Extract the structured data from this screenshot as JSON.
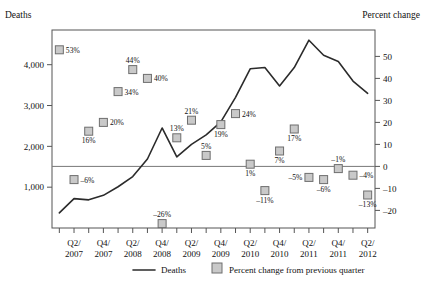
{
  "chart_data": {
    "type": "line",
    "title": "",
    "xlabel": "",
    "ylabel": "Deaths",
    "y2label": "Percent change",
    "grid": false,
    "legend_position": "bottom",
    "x": [
      "Q1/2007",
      "Q2/2007",
      "Q3/2007",
      "Q4/2007",
      "Q1/2008",
      "Q2/2008",
      "Q3/2008",
      "Q4/2008",
      "Q1/2009",
      "Q2/2009",
      "Q3/2009",
      "Q4/2009",
      "Q1/2010",
      "Q2/2010",
      "Q3/2010",
      "Q4/2010",
      "Q1/2011",
      "Q2/2011",
      "Q3/2011",
      "Q4/2011",
      "Q1/2012",
      "Q2/2012"
    ],
    "xtick_labels": [
      "Q2/\n2007",
      "Q4/\n2007",
      "Q2/\n2008",
      "Q4/\n2008",
      "Q2/\n2009",
      "Q4/\n2009",
      "Q2/\n2010",
      "Q4/\n2010",
      "Q2/\n2011",
      "Q4/\n2011",
      "Q2/\n2012"
    ],
    "xtick_labels_flat": [
      "Q2/ 2007",
      "Q4/ 2007",
      "Q2/ 2008",
      "Q4/ 2008",
      "Q2/ 2009",
      "Q4/ 2009",
      "Q2/ 2010",
      "Q4/ 2010",
      "Q2/ 2011",
      "Q4/ 2011",
      "Q2/ 2012"
    ],
    "ytick_labels": [
      "4,000",
      "3,000",
      "2,000",
      "1,000"
    ],
    "ytick_values": [
      4000,
      3000,
      2000,
      1000
    ],
    "ylim": [
      0,
      4850
    ],
    "y2tick_labels": [
      "50",
      "40",
      "30",
      "20",
      "10",
      "0",
      "-10",
      "-20"
    ],
    "y2tick_values": [
      50,
      40,
      30,
      20,
      10,
      0,
      -10,
      -20
    ],
    "y2lim": [
      -28,
      62
    ],
    "series": [
      {
        "name": "Deaths",
        "type": "line",
        "axis": "left",
        "values": [
          370,
          720,
          690,
          800,
          1010,
          1260,
          1690,
          2450,
          1740,
          2050,
          2280,
          2600,
          3200,
          3900,
          3930,
          3480,
          3930,
          4600,
          4230,
          4080,
          3600,
          3300
        ]
      },
      {
        "name": "Percent change from previous quarter",
        "type": "scatter",
        "axis": "right",
        "values": [
          53,
          -6,
          16,
          20,
          34,
          44,
          40,
          -26,
          13,
          21,
          5,
          19,
          24,
          1,
          -11,
          7,
          17,
          -5,
          -6,
          -1,
          -4,
          -13
        ],
        "labels": [
          "53%",
          "-6%",
          "16%",
          "20%",
          "34%",
          "44%",
          "40%",
          "-26%",
          "13%",
          "21%",
          "5%",
          "19%",
          "24%",
          "1%",
          "-11%",
          "7%",
          "17%",
          "-5%",
          "-6%",
          "-1%",
          "-4%",
          "-13%"
        ]
      }
    ],
    "annotations": []
  },
  "legend": {
    "deaths_label": "Deaths",
    "percent_label": "Percent change from previous quarter"
  },
  "axes": {
    "left_title": "Deaths",
    "right_title": "Percent change"
  },
  "colors": {
    "line": "#2b2b2b",
    "marker_fill": "#c9c9c9",
    "marker_stroke": "#6e6e6e",
    "frame": "#555555",
    "text": "#111111"
  }
}
